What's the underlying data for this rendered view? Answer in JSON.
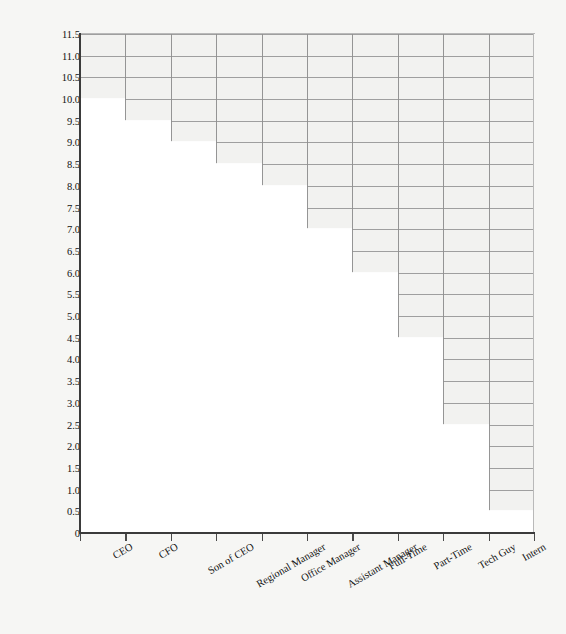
{
  "chart_data": {
    "type": "bar",
    "title": "",
    "subtitle": "",
    "xlabel": "",
    "ylabel": "Amount of Praise (in laudits)",
    "categories": [
      "CEO",
      "CFO",
      "Son of CEO",
      "Regional Manager",
      "Office  Manager",
      "Assistant Manager",
      "Full-Time",
      "Part-Time",
      "Tech Guy",
      "Intern"
    ],
    "values": [
      10.0,
      9.5,
      9.0,
      8.5,
      8.0,
      7.0,
      6.0,
      4.5,
      2.5,
      0.5
    ],
    "ylim": [
      0,
      11.5
    ],
    "yticks": [
      "11.5",
      "11.0",
      "10.5",
      "10.0",
      "9.5",
      "9.0",
      "8.5",
      "8.0",
      "7.5",
      "7.0",
      "6.5",
      "6.0",
      "5.5",
      "5.0",
      "4.5",
      "4.0",
      "3.5",
      "3.0",
      "2.5",
      "2.0",
      "1.5",
      "1.0",
      "0.5",
      "0"
    ],
    "ytick_values": [
      11.5,
      11.0,
      10.5,
      10.0,
      9.5,
      9.0,
      8.5,
      8.0,
      7.5,
      7.0,
      6.5,
      6.0,
      5.5,
      5.0,
      4.5,
      4.0,
      3.5,
      3.0,
      2.5,
      2.0,
      1.5,
      1.0,
      0.5,
      0
    ],
    "grid": true,
    "legend": null,
    "bar_color": "#ffffff",
    "plot_background": "#f2f2f0",
    "grid_color": "#9a9a9a",
    "axis_color": "#3b3b3b",
    "figure_background": "#f6f6f4"
  }
}
